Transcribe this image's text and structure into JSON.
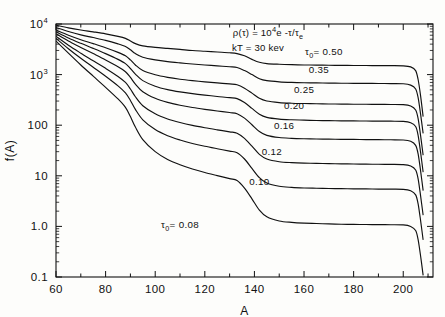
{
  "figure": {
    "title": "",
    "annotations": {
      "equation_rho": "ρ(τ) = 10",
      "equation_rho_exp": "4",
      "equation_rho_tail": "e -τ/τ",
      "equation_rho_sub": "e",
      "temperature": "kT = 30 kev"
    }
  },
  "axes": {
    "xlabel": "A",
    "ylabel": "f(A)",
    "xlim": [
      60,
      212
    ],
    "ylim": [
      0.1,
      10000
    ],
    "yscale": "log",
    "xscale": "linear",
    "xticks": [
      60,
      80,
      100,
      120,
      140,
      160,
      180,
      200
    ],
    "xticklabels": [
      "60",
      "80",
      "100",
      "120",
      "140",
      "160",
      "180",
      "200"
    ],
    "xminor_step": 10,
    "yticks": [
      0.1,
      1,
      10,
      100,
      1000,
      10000
    ],
    "yticklabels": [
      "0.1",
      "1.0",
      "10",
      "100",
      "10",
      "10"
    ],
    "ytick_display": [
      {
        "value": 10000,
        "base": "10",
        "exp": "4"
      },
      {
        "value": 1000,
        "base": "10",
        "exp": "3"
      },
      {
        "value": 100,
        "base": "100",
        "exp": ""
      },
      {
        "value": 10,
        "base": "10",
        "exp": ""
      },
      {
        "value": 1,
        "base": "1.0",
        "exp": ""
      },
      {
        "value": 0.1,
        "base": "0.1",
        "exp": ""
      }
    ],
    "grid": false
  },
  "chart_data": {
    "type": "line",
    "title": "",
    "xlabel": "A",
    "ylabel": "f(A)",
    "xlim": [
      60,
      212
    ],
    "ylim": [
      0.1,
      10000
    ],
    "yscale": "log",
    "grid": false,
    "legend_position": "inline-curve-labels",
    "annotations": [
      "ρ(τ) = 10⁴e -τ/τe",
      "kT = 30 kev"
    ],
    "x": [
      60,
      65,
      70,
      75,
      80,
      85,
      88,
      90,
      92,
      95,
      100,
      105,
      110,
      115,
      120,
      125,
      130,
      133,
      136,
      139,
      142,
      145,
      150,
      155,
      160,
      165,
      170,
      175,
      180,
      185,
      190,
      195,
      200,
      203,
      205,
      206,
      207,
      208
    ],
    "series": [
      {
        "name": "τ₀ = 0.50",
        "label": "0.50",
        "label_prefix": "τ0= ",
        "values": [
          9500,
          8400,
          7600,
          7000,
          6400,
          5700,
          5200,
          4600,
          4100,
          3700,
          3450,
          3300,
          3150,
          3000,
          2900,
          2800,
          2700,
          2600,
          2350,
          2000,
          1750,
          1650,
          1600,
          1570,
          1550,
          1540,
          1530,
          1520,
          1515,
          1510,
          1505,
          1500,
          1490,
          1420,
          1200,
          800,
          380,
          150
        ]
      },
      {
        "name": "τ₀ = 0.35",
        "label": "0.35",
        "label_prefix": "",
        "values": [
          8500,
          7100,
          6100,
          5400,
          4750,
          4050,
          3600,
          3100,
          2600,
          2200,
          1950,
          1800,
          1700,
          1620,
          1550,
          1490,
          1430,
          1380,
          1200,
          1000,
          830,
          760,
          720,
          700,
          690,
          685,
          680,
          675,
          672,
          670,
          668,
          665,
          660,
          620,
          520,
          350,
          165,
          70
        ]
      },
      {
        "name": "τ₀ = 0.25",
        "label": "0.25",
        "label_prefix": "",
        "values": [
          7600,
          6000,
          4900,
          4100,
          3400,
          2750,
          2350,
          1950,
          1550,
          1200,
          990,
          880,
          810,
          760,
          720,
          685,
          655,
          630,
          540,
          430,
          340,
          300,
          280,
          272,
          268,
          265,
          263,
          261,
          260,
          259,
          258,
          257,
          255,
          240,
          200,
          135,
          62,
          26
        ]
      },
      {
        "name": "τ₀ = 0.20",
        "label": "0.20",
        "label_prefix": "",
        "values": [
          7000,
          5300,
          4150,
          3300,
          2600,
          2000,
          1650,
          1320,
          1020,
          760,
          590,
          505,
          455,
          420,
          393,
          370,
          350,
          335,
          280,
          215,
          165,
          143,
          132,
          128,
          126,
          124,
          123,
          122,
          121.5,
          121,
          120.5,
          120,
          119,
          112,
          94,
          63,
          29,
          12
        ]
      },
      {
        "name": "τ₀ = 0.16",
        "label": "0.16",
        "label_prefix": "",
        "values": [
          6400,
          4600,
          3450,
          2600,
          1950,
          1430,
          1140,
          880,
          650,
          460,
          340,
          282,
          248,
          224,
          206,
          191,
          178,
          169,
          138,
          102,
          75,
          63,
          57,
          55,
          54,
          53.4,
          53,
          52.6,
          52.3,
          52,
          51.8,
          51.5,
          51,
          48,
          40,
          27,
          12.5,
          5.2
        ]
      },
      {
        "name": "τ₀ = 0.12",
        "label": "0.12",
        "label_prefix": "",
        "values": [
          5700,
          3800,
          2650,
          1880,
          1330,
          920,
          700,
          520,
          365,
          243,
          168,
          133,
          113,
          99,
          89,
          81,
          74,
          69.5,
          55,
          38.5,
          26.5,
          21.5,
          19,
          18.2,
          17.8,
          17.6,
          17.4,
          17.25,
          17.1,
          17,
          16.9,
          16.8,
          16.6,
          15.6,
          13,
          8.7,
          4,
          1.7
        ]
      },
      {
        "name": "τ₀ = 0.10",
        "label": "0.10",
        "label_prefix": "",
        "values": [
          5200,
          3250,
          2100,
          1400,
          930,
          600,
          435,
          308,
          205,
          128,
          82,
          62,
          51,
          43.5,
          38.3,
          34.3,
          30.8,
          28.6,
          21.5,
          14,
          9.2,
          7.2,
          6.2,
          5.9,
          5.75,
          5.68,
          5.62,
          5.57,
          5.53,
          5.5,
          5.47,
          5.44,
          5.4,
          5.05,
          4.2,
          2.8,
          1.3,
          0.55
        ]
      },
      {
        "name": "τ₀ = 0.08",
        "label": "0.08",
        "label_prefix": "τ0= ",
        "values": [
          4600,
          2650,
          1550,
          930,
          560,
          330,
          225,
          148,
          92,
          52,
          30,
          21,
          16.5,
          13.6,
          11.6,
          10.1,
          8.8,
          8.05,
          5.7,
          3.5,
          2.1,
          1.55,
          1.28,
          1.2,
          1.16,
          1.14,
          1.12,
          1.105,
          1.095,
          1.09,
          1.085,
          1.08,
          1.07,
          1.0,
          0.83,
          0.55,
          0.26,
          0.11
        ]
      }
    ],
    "curve_labels": [
      {
        "text": "0.50",
        "prefix": "τ0= ",
        "x": 168,
        "y_value": 2400
      },
      {
        "text": "0.35",
        "prefix": "",
        "x": 166,
        "y_value": 1080
      },
      {
        "text": "0.25",
        "prefix": "",
        "x": 160,
        "y_value": 430
      },
      {
        "text": "0.20",
        "prefix": "",
        "x": 156,
        "y_value": 205
      },
      {
        "text": "0.16",
        "prefix": "",
        "x": 152,
        "y_value": 86
      },
      {
        "text": "0.12",
        "prefix": "",
        "x": 147,
        "y_value": 26
      },
      {
        "text": "0.10",
        "prefix": "",
        "x": 142,
        "y_value": 6.6
      },
      {
        "text": "0.08",
        "prefix": "τ0= ",
        "x": 110,
        "y_value": 0.95
      }
    ]
  }
}
